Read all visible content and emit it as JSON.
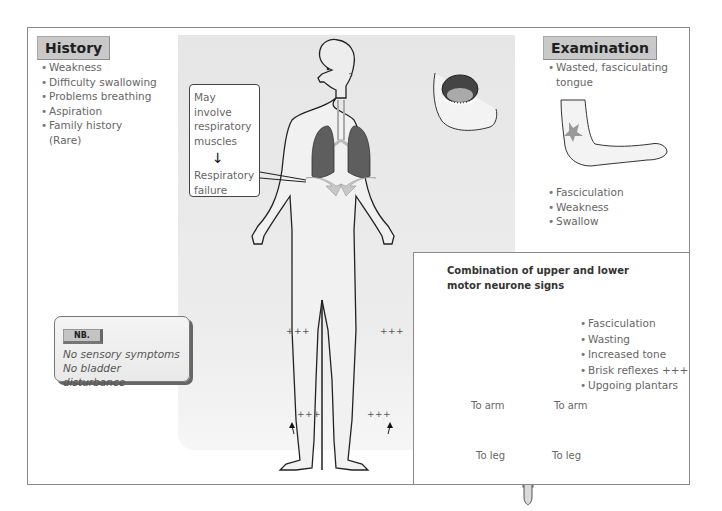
{
  "history": {
    "title": "History",
    "items": [
      "Weakness",
      "Difficulty swallowing",
      "Problems breathing",
      "Aspiration",
      "Family history (Rare)"
    ]
  },
  "examination": {
    "title": "Examination",
    "items_top": [
      "Wasted, fasciculating tongue"
    ],
    "items_bottom": [
      "Fasciculation",
      "Weakness",
      "Swallow"
    ]
  },
  "respiratory_box": {
    "line1": "May involve respiratory muscles",
    "arrow": "↓",
    "line2": "Respiratory failure"
  },
  "nb_box": {
    "badge": "NB.",
    "lines": [
      "No sensory symptoms",
      "No bladder disturbance"
    ]
  },
  "motor_panel": {
    "title": "Combination of upper and lower motor neurone signs",
    "signs": [
      "Fasciculation",
      "Wasting",
      "Increased tone",
      "Brisk reflexes +++",
      "Upgoing plantars"
    ],
    "labels": {
      "arm_left": "To arm",
      "arm_right": "To arm",
      "leg_left": "To leg",
      "leg_right": "To leg"
    }
  },
  "body_annotations": {
    "knee_left": "+++",
    "knee_right": "+++",
    "ankle_left": "+++",
    "ankle_right": "+++"
  },
  "bullet": "•",
  "colors": {
    "title_tag_bg": "#c9c9c9",
    "lung": "#5e5e5e",
    "background_gray": "#e8e8e8",
    "frame": "#8a8a8a"
  }
}
